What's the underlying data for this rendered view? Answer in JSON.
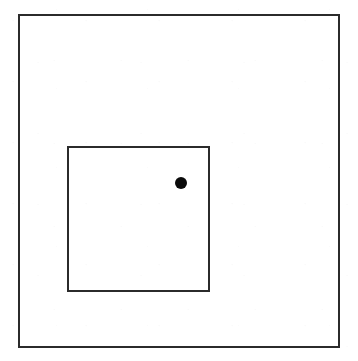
{
  "figure": {
    "background_color": "#ffffff",
    "stroke_color": "#2b2b2b",
    "point_color": "#0a0a0a",
    "outer_rect": {
      "name": "outer-rectangle",
      "x": 18,
      "y": 14,
      "width": 322,
      "height": 334,
      "stroke_width": 2,
      "fill": "none"
    },
    "inner_rect": {
      "name": "inner-square",
      "x": 67,
      "y": 146,
      "width": 143,
      "height": 146,
      "stroke_width": 2,
      "fill": "none"
    },
    "point": {
      "name": "point-marker",
      "cx": 181,
      "cy": 183,
      "radius": 6,
      "fill": "#0a0a0a"
    }
  },
  "caption": {
    "text": "",
    "visible": "clipped",
    "note": "caption line is cut off by the image boundary and is not legible"
  }
}
